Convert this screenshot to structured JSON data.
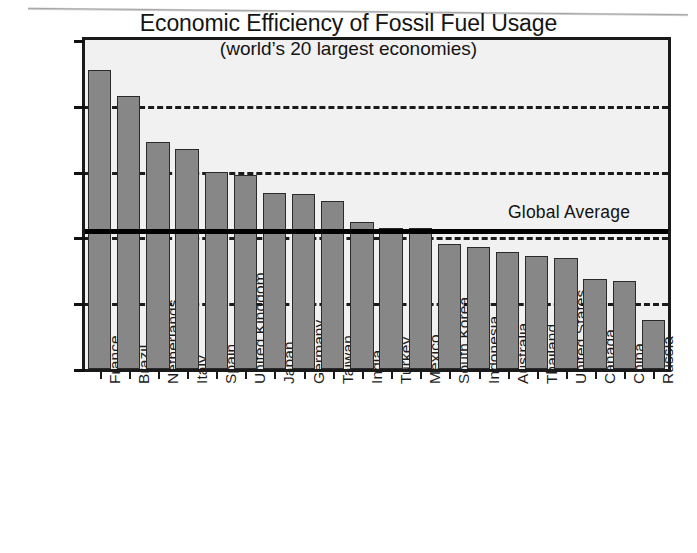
{
  "chart_data": {
    "type": "bar",
    "title": "Economic Efficiency of Fossil Fuel Usage",
    "subtitle": "(world’s 20 largest economies)",
    "xlabel": "",
    "ylabel": "GDP Dollars / kg Carbon Emitted",
    "ylim": [
      0,
      20
    ],
    "ytick_labels": [
      "0",
      "4",
      "8",
      "12",
      "16",
      "20"
    ],
    "ytick_values": [
      0,
      4,
      8,
      12,
      16,
      20
    ],
    "grid": "horizontal-dashed",
    "legend": "none",
    "categories": [
      "France",
      "Brazil",
      "Netherlands",
      "Italy",
      "Spain",
      "United Kingdom",
      "Japan",
      "Germany",
      "Taiwan",
      "India",
      "Turkey",
      "Mexico",
      "South Korea",
      "Indonesia",
      "Australia",
      "Thailand",
      "United States",
      "Canada",
      "China",
      "Russia"
    ],
    "values": [
      18.2,
      16.6,
      13.8,
      13.4,
      12.0,
      11.8,
      10.7,
      10.65,
      10.2,
      8.95,
      8.6,
      8.55,
      7.6,
      7.4,
      7.1,
      6.85,
      6.75,
      5.5,
      5.35,
      3.0
    ],
    "annotations": [
      {
        "name": "global-average",
        "label": "Global Average",
        "value": 8.5
      }
    ],
    "colors": {
      "bar_fill": "#878787",
      "bar_stroke": "#2a2a2a",
      "plot_background": "#f1f1f1",
      "frame": "#1a1a1a",
      "gridline": "#1b1b1b",
      "average_line": "#000000",
      "text": "#111111"
    }
  }
}
